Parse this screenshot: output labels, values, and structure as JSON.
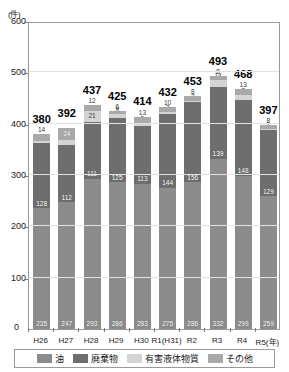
{
  "axis": {
    "unit_label": "(件)",
    "zero_label": "0",
    "y_ticks": [
      0,
      100,
      200,
      300,
      400,
      500,
      600
    ],
    "x_unit_suffix": "(年)"
  },
  "legend": {
    "items": [
      {
        "label": "油",
        "color": "#8c8c8c",
        "key": "oil"
      },
      {
        "label": "廃棄物",
        "color": "#6e6e6e",
        "key": "waste"
      },
      {
        "label": "有害液体物質",
        "color": "#d4d4d4",
        "key": "hazardous"
      },
      {
        "label": "その他",
        "color": "#a9a9a9",
        "key": "other"
      }
    ]
  },
  "chart_data": {
    "type": "bar",
    "stacked": true,
    "title": "",
    "xlabel": "(年)",
    "ylabel": "(件)",
    "ylim": [
      0,
      600
    ],
    "ytick_step": 100,
    "grid": true,
    "legend_position": "bottom",
    "categories": [
      "H26",
      "H27",
      "H28",
      "H29",
      "H30",
      "R1(H31)",
      "R2",
      "R3",
      "R4",
      "R5"
    ],
    "totals": [
      380,
      392,
      437,
      425,
      414,
      432,
      453,
      493,
      468,
      397
    ],
    "series": [
      {
        "name": "油",
        "key": "oil",
        "color": "#8c8c8c",
        "values": [
          235,
          247,
          293,
          286,
          283,
          275,
          286,
          332,
          299,
          259
        ]
      },
      {
        "name": "廃棄物",
        "key": "waste",
        "color": "#6e6e6e",
        "values": [
          128,
          112,
          111,
          125,
          113,
          144,
          156,
          139,
          148,
          129
        ]
      },
      {
        "name": "有害液体物質",
        "key": "hazardous",
        "color": "#d4d4d4",
        "values": [
          3,
          9,
          21,
          8,
          5,
          3,
          3,
          14,
          8,
          1
        ]
      },
      {
        "name": "その他",
        "key": "other",
        "color": "#a9a9a9",
        "values": [
          14,
          24,
          12,
          6,
          13,
          10,
          8,
          8,
          13,
          8
        ]
      }
    ]
  }
}
